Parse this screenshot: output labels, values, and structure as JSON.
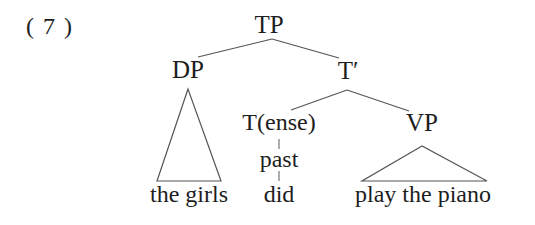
{
  "figure": {
    "example_number": "( 7 )",
    "type": "syntax-tree",
    "ink_color": "#1d1d1d",
    "background_color": "#ffffff",
    "line_color": "#555555"
  },
  "tree": {
    "nodes": {
      "tp": "TP",
      "dp": "DP",
      "tbar": "T′",
      "tense": "T(ense)",
      "vp": "VP"
    },
    "features": {
      "past": "past"
    },
    "terminals": {
      "subject": "the girls",
      "auxiliary": "did",
      "predicate": "play the piano"
    }
  }
}
